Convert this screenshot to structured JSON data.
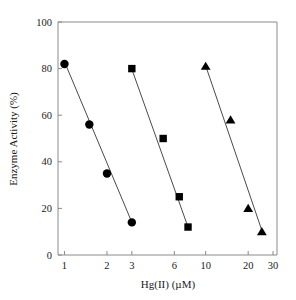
{
  "chart_data": {
    "type": "scatter",
    "title": "",
    "xlabel": "Hg(II) (µM)",
    "ylabel": "Enzyme Activity (%)",
    "xscale": "log",
    "yscale": "linear",
    "xlim": [
      0.9,
      32
    ],
    "ylim": [
      0,
      100
    ],
    "grid": false,
    "legend": "none",
    "xticks": [
      1,
      2,
      3,
      6,
      10,
      20,
      30
    ],
    "xticklabels": [
      "1",
      "2",
      "3",
      "6",
      "10",
      "20",
      "30"
    ],
    "yticks": [
      0,
      20,
      40,
      60,
      80,
      100
    ],
    "yticklabels": [
      "0",
      "20",
      "40",
      "60",
      "80",
      "100"
    ],
    "series": [
      {
        "name": "series-circle",
        "marker": "circle",
        "color": "#000000",
        "x": [
          1.0,
          1.5,
          2.0,
          3.0
        ],
        "y": [
          82,
          56,
          35,
          14
        ],
        "fit_line": {
          "x": [
            1.0,
            3.05
          ],
          "y": [
            83,
            13
          ]
        }
      },
      {
        "name": "series-square",
        "marker": "square",
        "color": "#000000",
        "x": [
          3.0,
          5.0,
          6.5,
          7.5
        ],
        "y": [
          80,
          50,
          25,
          12
        ],
        "fit_line": {
          "x": [
            2.95,
            7.6
          ],
          "y": [
            81,
            11
          ]
        }
      },
      {
        "name": "series-triangle",
        "marker": "triangle",
        "color": "#000000",
        "x": [
          10.0,
          15.0,
          20.0,
          25.0
        ],
        "y": [
          81,
          58,
          20,
          10
        ],
        "fit_line": {
          "x": [
            9.9,
            25.5
          ],
          "y": [
            82,
            9
          ]
        }
      }
    ]
  },
  "axes": {
    "x_title": "Hg(II) (µM)",
    "y_title": "Enzyme Activity (%)"
  },
  "colors": {
    "marker": "#000000",
    "line": "#4a4a4a",
    "frame": "#8a8a8a",
    "background": "#ffffff"
  }
}
